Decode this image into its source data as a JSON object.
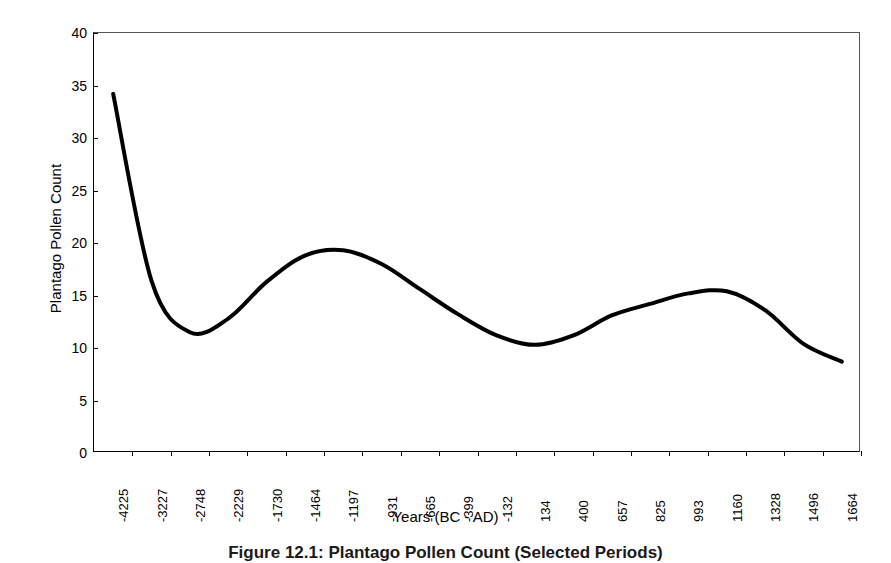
{
  "figure": {
    "caption": "Figure 12.1:  Plantago Pollen Count (Selected Periods)"
  },
  "chart_data": {
    "type": "line",
    "title": "",
    "xlabel": "Years (BC - AD)",
    "ylabel": "Plantago Pollen Count",
    "ylim": [
      0,
      40
    ],
    "ytick_step": 5,
    "yticks": [
      "40",
      "35",
      "30",
      "25",
      "20",
      "15",
      "10",
      "5",
      "0"
    ],
    "grid": false,
    "legend": "none",
    "categories": [
      "-4225",
      "-3227",
      "-2748",
      "-2229",
      "-1730",
      "-1464",
      "-1197",
      "-931",
      "-665",
      "-399",
      "-132",
      "134",
      "400",
      "657",
      "825",
      "993",
      "1160",
      "1328",
      "1496",
      "1664"
    ],
    "values": [
      34.2,
      16.4,
      11.5,
      12.8,
      16.3,
      18.8,
      19.3,
      18.0,
      15.6,
      13.2,
      11.2,
      10.3,
      11.2,
      13.1,
      14.2,
      15.2,
      15.4,
      13.6,
      10.4,
      8.7
    ],
    "series_name": "Plantago Pollen Count",
    "line_color": "#000000",
    "line_width": 4,
    "annotations": {
      "start_value": 34.2,
      "first_minimum": 11.3,
      "first_maximum": 19.3,
      "second_minimum": 10.2,
      "second_maximum": 15.4,
      "end_value": 8.7
    }
  }
}
